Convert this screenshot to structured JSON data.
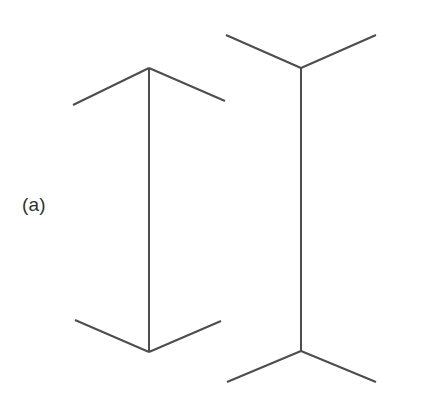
{
  "figure": {
    "panel_label": "(a)",
    "background_color": "#ffffff",
    "line_color": "#4d4d4d",
    "label_color": "#333333",
    "line_width": 2,
    "canvas": {
      "width": 422,
      "height": 411
    },
    "shapes": [
      {
        "name": "left-figure-arrows-in",
        "description": "vertical shaft with inward-pointing (arrowhead) fins at both ends",
        "shaft": {
          "x1": 149,
          "y1": 68,
          "x2": 149,
          "y2": 352
        },
        "fins": [
          {
            "name": "top-left-fin",
            "x1": 149,
            "y1": 68,
            "x2": 73,
            "y2": 105
          },
          {
            "name": "top-right-fin",
            "x1": 149,
            "y1": 68,
            "x2": 225,
            "y2": 101
          },
          {
            "name": "bottom-left-fin",
            "x1": 149,
            "y1": 352,
            "x2": 75,
            "y2": 320
          },
          {
            "name": "bottom-right-fin",
            "x1": 149,
            "y1": 352,
            "x2": 221,
            "y2": 321
          }
        ]
      },
      {
        "name": "right-figure-arrows-out",
        "description": "vertical shaft with outward-pointing (feather) fins at both ends",
        "shaft": {
          "x1": 301,
          "y1": 68,
          "x2": 301,
          "y2": 351
        },
        "fins": [
          {
            "name": "top-left-fin",
            "x1": 301,
            "y1": 68,
            "x2": 226,
            "y2": 35
          },
          {
            "name": "top-right-fin",
            "x1": 301,
            "y1": 68,
            "x2": 376,
            "y2": 35
          },
          {
            "name": "bottom-left-fin",
            "x1": 301,
            "y1": 351,
            "x2": 227,
            "y2": 382
          },
          {
            "name": "bottom-right-fin",
            "x1": 301,
            "y1": 351,
            "x2": 376,
            "y2": 382
          }
        ]
      }
    ]
  }
}
